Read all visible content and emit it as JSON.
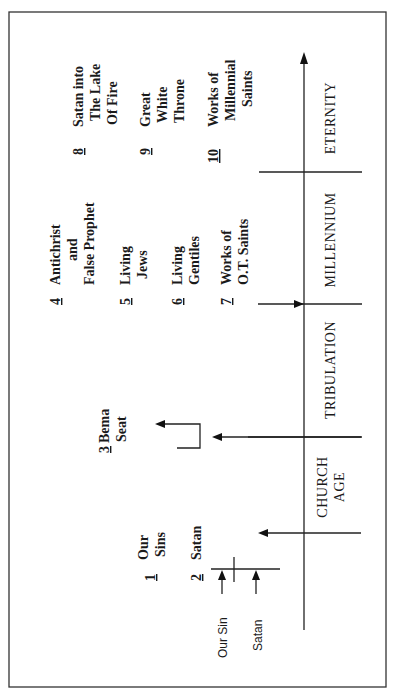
{
  "diagram": {
    "orientation": "rotated -90deg (reads bottom-to-top)",
    "timeline": {
      "periods": [
        {
          "label_lines": [
            "CHURCH",
            "AGE"
          ]
        },
        {
          "label_lines": [
            "TRIBULATION"
          ]
        },
        {
          "label_lines": [
            "MILLENNIUM"
          ]
        },
        {
          "label_lines": [
            "ETERNITY"
          ]
        }
      ]
    },
    "judgments": [
      {
        "number": "1",
        "lines": [
          "Our",
          "Sins"
        ]
      },
      {
        "number": "2",
        "lines": [
          "Satan"
        ]
      },
      {
        "number": "3",
        "lines": [
          "Bema",
          "Seat"
        ]
      },
      {
        "number": "4",
        "lines": [
          "Antichrist",
          "and",
          "False Prophet"
        ]
      },
      {
        "number": "5",
        "lines": [
          "Living",
          "Jews"
        ]
      },
      {
        "number": "6",
        "lines": [
          "Living",
          "Gentiles"
        ]
      },
      {
        "number": "7",
        "lines": [
          "Works of",
          "O.T. Saints"
        ]
      },
      {
        "number": "8",
        "lines": [
          "Satan into",
          "The Lake",
          "Of Fire"
        ]
      },
      {
        "number": "9",
        "lines": [
          "Great",
          "White",
          "Throne"
        ]
      },
      {
        "number": "10",
        "lines": [
          "Works of",
          "Millennial",
          "Saints"
        ]
      }
    ],
    "cross_labels": [
      "Our Sin",
      "Satan"
    ],
    "colors": {
      "ink": "#1a1a1a",
      "background": "#ffffff"
    }
  }
}
